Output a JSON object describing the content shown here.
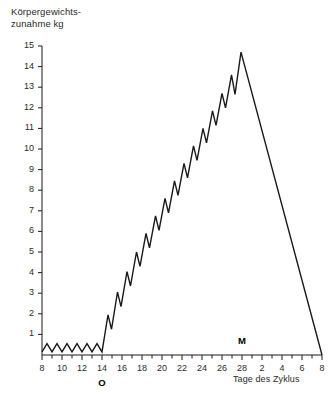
{
  "chart_data": {
    "type": "line",
    "title": "Körpergewichts-\nzunahme kg",
    "ylabel": "Körpergewichtszunahme kg",
    "xlabel": "Tage des Zyklus",
    "grid": false,
    "legend": "none",
    "ylim": [
      0,
      15
    ],
    "xlim": [
      8,
      36
    ],
    "yticks": [
      1,
      2,
      3,
      4,
      5,
      6,
      7,
      8,
      9,
      10,
      11,
      12,
      13,
      14,
      15
    ],
    "ytick_labels": [
      "1",
      "2",
      "3",
      "4",
      "5",
      "6",
      "7",
      "8",
      "9",
      "10",
      "11",
      "12",
      "13",
      "14",
      "15"
    ],
    "xticks": [
      8,
      10,
      12,
      14,
      16,
      18,
      20,
      22,
      24,
      26,
      28,
      30,
      32,
      34,
      36
    ],
    "xtick_labels": [
      "8",
      "10",
      "12",
      "14",
      "16",
      "18",
      "20",
      "22",
      "24",
      "26",
      "28",
      "2",
      "4",
      "6",
      "8"
    ],
    "minor_tick_interval": 1,
    "annotations": [
      {
        "text": "O",
        "x": 14,
        "position": "below-axis",
        "meaning": "Ovulation"
      },
      {
        "text": "M",
        "x": 28,
        "position": "above-axis",
        "meaning": "Menstruation"
      }
    ],
    "series": [
      {
        "name": "Körpergewichtszunahme",
        "color": "#1a1a1a",
        "points": [
          {
            "x": 8.0,
            "y": 0.15
          },
          {
            "x": 8.5,
            "y": 0.55
          },
          {
            "x": 9.0,
            "y": 0.15
          },
          {
            "x": 9.5,
            "y": 0.55
          },
          {
            "x": 10.0,
            "y": 0.15
          },
          {
            "x": 10.5,
            "y": 0.55
          },
          {
            "x": 11.0,
            "y": 0.15
          },
          {
            "x": 11.5,
            "y": 0.55
          },
          {
            "x": 12.0,
            "y": 0.15
          },
          {
            "x": 12.5,
            "y": 0.55
          },
          {
            "x": 13.0,
            "y": 0.15
          },
          {
            "x": 13.5,
            "y": 0.55
          },
          {
            "x": 14.0,
            "y": 0.15
          },
          {
            "x": 14.6,
            "y": 1.95
          },
          {
            "x": 14.95,
            "y": 1.25
          },
          {
            "x": 15.55,
            "y": 3.05
          },
          {
            "x": 15.9,
            "y": 2.35
          },
          {
            "x": 16.5,
            "y": 4.05
          },
          {
            "x": 16.85,
            "y": 3.35
          },
          {
            "x": 17.45,
            "y": 5.0
          },
          {
            "x": 17.8,
            "y": 4.3
          },
          {
            "x": 18.4,
            "y": 5.9
          },
          {
            "x": 18.75,
            "y": 5.2
          },
          {
            "x": 19.35,
            "y": 6.75
          },
          {
            "x": 19.7,
            "y": 6.05
          },
          {
            "x": 20.3,
            "y": 7.6
          },
          {
            "x": 20.65,
            "y": 6.9
          },
          {
            "x": 21.25,
            "y": 8.45
          },
          {
            "x": 21.6,
            "y": 7.75
          },
          {
            "x": 22.2,
            "y": 9.3
          },
          {
            "x": 22.55,
            "y": 8.6
          },
          {
            "x": 23.15,
            "y": 10.15
          },
          {
            "x": 23.5,
            "y": 9.45
          },
          {
            "x": 24.1,
            "y": 11.0
          },
          {
            "x": 24.45,
            "y": 10.3
          },
          {
            "x": 25.05,
            "y": 11.85
          },
          {
            "x": 25.4,
            "y": 11.15
          },
          {
            "x": 26.0,
            "y": 12.7
          },
          {
            "x": 26.35,
            "y": 12.0
          },
          {
            "x": 26.95,
            "y": 13.6
          },
          {
            "x": 27.3,
            "y": 12.65
          },
          {
            "x": 27.9,
            "y": 14.7
          },
          {
            "x": 36.0,
            "y": 0.0
          }
        ],
        "peak": {
          "x": 27.9,
          "y": 14.7
        },
        "description": "Baseline oscillation days 8-14, sawtooth rise after ovulation to peak ~14.7 kg, then linear decline to zero at day 8 of next cycle"
      }
    ]
  }
}
